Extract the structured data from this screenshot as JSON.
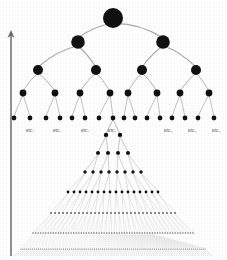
{
  "figure": {
    "background_color": "#ffffff",
    "node_color": "#111111",
    "edge_color": "#9a9a9a",
    "axis_color": "#6b6b6b",
    "text_color": "#2b2b2b",
    "width": 227,
    "height": 260
  },
  "axis": {
    "name": "time-arrow",
    "orientation": "vertical-up",
    "x": 11,
    "y_bottom": 256,
    "y_top": 30,
    "label": "",
    "arrowhead": "up"
  },
  "etc_labels": [
    {
      "text": "etc.",
      "x": 30,
      "y": 127
    },
    {
      "text": "etc.",
      "x": 57,
      "y": 127
    },
    {
      "text": "etc.",
      "x": 85,
      "y": 127
    },
    {
      "text": "etc.",
      "x": 112,
      "y": 127
    },
    {
      "text": "etc.",
      "x": 168,
      "y": 127
    },
    {
      "text": "etc.",
      "x": 192,
      "y": 127
    },
    {
      "text": "etc.",
      "x": 216,
      "y": 127
    }
  ],
  "chart_data": {
    "type": "diagram",
    "xlabel": "",
    "ylabel": "",
    "tree": {
      "direction": "top-down",
      "branching_factor": 2,
      "levels": [
        {
          "level": 0,
          "count": 1,
          "y": 18,
          "radius": 10.0,
          "xs": [
            113
          ]
        },
        {
          "level": 1,
          "count": 2,
          "y": 42,
          "radius": 6.8,
          "xs": [
            78,
            163
          ]
        },
        {
          "level": 2,
          "count": 4,
          "y": 70,
          "radius": 5.0,
          "xs": [
            38,
            96,
            142,
            196
          ]
        },
        {
          "level": 3,
          "count": 8,
          "y": 93,
          "radius": 3.4,
          "xs": [
            23,
            55,
            80,
            110,
            128,
            157,
            180,
            209
          ]
        },
        {
          "level": 4,
          "count": 16,
          "y": 118,
          "radius": 2.4,
          "xs": [
            14,
            30,
            46,
            60,
            72,
            85,
            99,
            113,
            124,
            135,
            147,
            160,
            172,
            185,
            198,
            214
          ]
        }
      ]
    },
    "fan": {
      "apex_x": 113,
      "apex_y": 118,
      "apex_source_level": 4,
      "apex_source_index": 7,
      "branching_factor": 2,
      "rows": [
        {
          "row": 1,
          "count": 2,
          "y": 135,
          "half_width": 7,
          "radius": 2.2
        },
        {
          "row": 2,
          "count": 4,
          "y": 153,
          "half_width": 15,
          "radius": 2.0
        },
        {
          "row": 3,
          "count": 8,
          "y": 172,
          "half_width": 28,
          "radius": 1.7
        },
        {
          "row": 4,
          "count": 16,
          "y": 192,
          "half_width": 45,
          "radius": 1.4
        },
        {
          "row": 5,
          "count": 32,
          "y": 213,
          "half_width": 62,
          "radius": 1.1
        },
        {
          "row": 6,
          "count": 64,
          "y": 233,
          "half_width": 80,
          "radius": 0.8
        },
        {
          "row": 7,
          "count": 96,
          "y": 249,
          "half_width": 92,
          "radius": 0.6
        }
      ]
    }
  }
}
